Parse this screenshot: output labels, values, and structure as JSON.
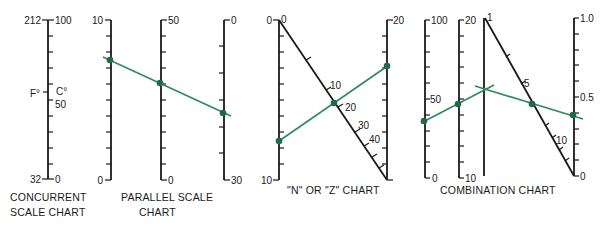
{
  "colors": {
    "ink": "#1a1a1a",
    "line": "#2f8a5c",
    "point": "#1e6b45",
    "background": "#ffffff"
  },
  "charts": {
    "concurrent": {
      "caption_line1": "CONCURRENT",
      "caption_line2": "SCALE CHART",
      "left_top": "212",
      "left_mid": "F°",
      "left_bottom": "32",
      "right_top": "100",
      "right_mid_unit": "C°",
      "right_mid": "50",
      "right_bottom": "0"
    },
    "parallel": {
      "caption_line1": "PARALLEL SCALE",
      "caption_line2": "CHART",
      "axis1_top": "10",
      "axis1_bottom": "0",
      "axis2_top": "50",
      "axis2_bottom": "0",
      "axis3_top": "0",
      "axis3_bottom": "30"
    },
    "n_chart": {
      "caption": "\"N\" OR \"Z\" CHART",
      "left_top": "0",
      "left_bottom": "10",
      "right_top": "20",
      "diag_start": "0",
      "diag_10": "10",
      "diag_20": "20",
      "diag_30": "30",
      "diag_40": "40"
    },
    "combination": {
      "caption": "COMBINATION CHART",
      "axisA_top": "100",
      "axisA_mid": "50",
      "axisA_bottom": "0",
      "axisB_top": "20",
      "axisB_bottom": "10",
      "axisC_top": "1",
      "diag_5": "5",
      "diag_10": "10",
      "right_top": "1.0",
      "right_mid": "0.5",
      "right_bottom": "0"
    }
  }
}
